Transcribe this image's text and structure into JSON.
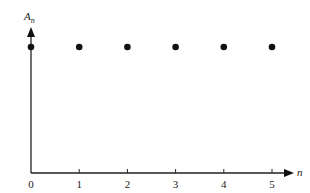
{
  "chart_data": {
    "type": "scatter",
    "title": "",
    "xlabel": "n",
    "ylabel": "A_n",
    "ylabel_main": "A",
    "ylabel_sub": "n",
    "x": [
      0,
      1,
      2,
      3,
      4,
      5
    ],
    "values": [
      1,
      1,
      1,
      1,
      1,
      1
    ],
    "x_ticks": [
      "0",
      "1",
      "2",
      "3",
      "4",
      "5"
    ],
    "y_ticks": [],
    "xlim": [
      0,
      5
    ],
    "ylim": [
      0,
      1
    ],
    "grid": false,
    "legend": null,
    "colors": {
      "points": "#111111",
      "axes": "#222222"
    }
  }
}
